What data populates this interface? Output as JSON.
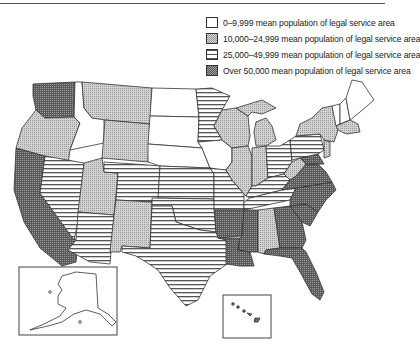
{
  "legend": {
    "items": [
      {
        "category": "c1",
        "label": "0–9,999 mean population of legal service area",
        "pattern": "white"
      },
      {
        "category": "c2",
        "label": "10,000–24,999 mean population of legal service area",
        "pattern": "dotted-gray"
      },
      {
        "category": "c3",
        "label": "25,000–49,999 mean population of legal service area",
        "pattern": "horizontal-stripes"
      },
      {
        "category": "c4",
        "label": "Over 50,000 mean population of legal service area",
        "pattern": "dark-crosshatch"
      }
    ]
  },
  "map": {
    "title": "",
    "states": {
      "WA": "c4",
      "OR": "c2",
      "CA": "c4",
      "NV": "c3",
      "ID": "c1",
      "MT": "c2",
      "WY": "c2",
      "UT": "c2",
      "AZ": "c3",
      "CO": "c3",
      "NM": "c2",
      "ND": "c1",
      "SD": "c1",
      "NE": "c1",
      "KS": "c3",
      "OK": "c3",
      "TX": "c3",
      "MN": "c3",
      "IA": "c1",
      "MO": "c3",
      "AR": "c4",
      "LA": "c4",
      "WI": "c2",
      "IL": "c2",
      "MI": "c2",
      "IN": "c2",
      "OH": "c3",
      "KY": "c3",
      "TN": "c3",
      "MS": "c4",
      "AL": "c2",
      "GA": "c4",
      "FL": "c4",
      "SC": "c4",
      "NC": "c4",
      "VA": "c4",
      "WV": "c2",
      "PA": "c3",
      "NY": "c2",
      "ME": "c1",
      "NH": "c1",
      "VT": "c1",
      "MA": "c2",
      "NJ": "c2",
      "MD": "c4",
      "AK": "c1",
      "HI": "c4"
    },
    "insets": [
      "Alaska",
      "Hawaii"
    ]
  }
}
